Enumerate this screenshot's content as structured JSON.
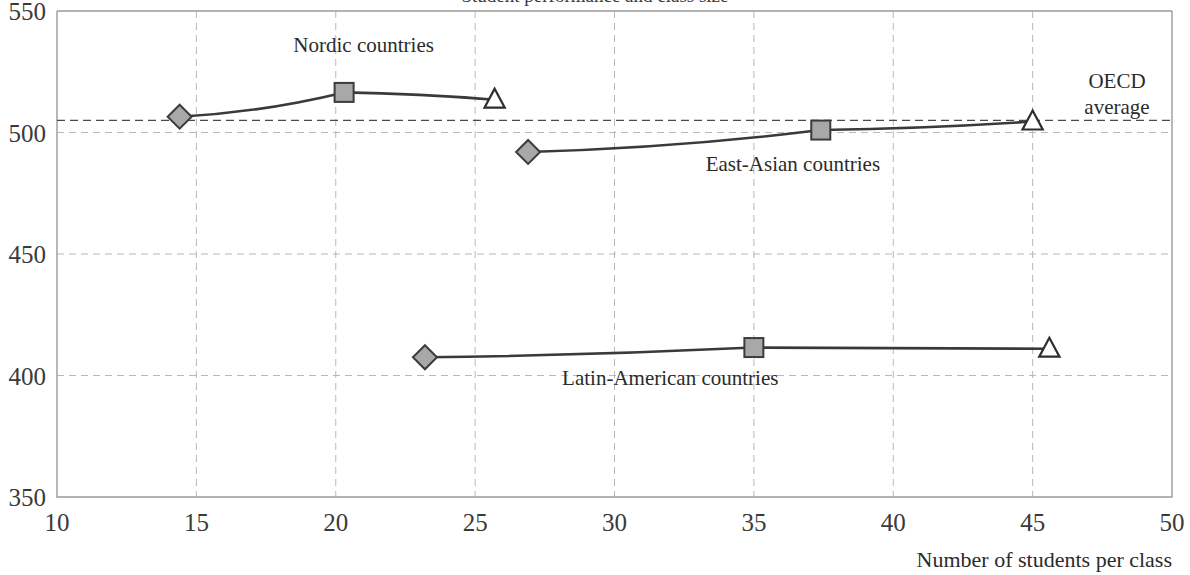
{
  "chart_data": {
    "type": "line",
    "title": "Student performance and class size",
    "xlabel": "Number of students per class",
    "ylabel": "",
    "xlim": [
      10,
      50
    ],
    "ylim": [
      350,
      550
    ],
    "xticks": [
      10,
      15,
      20,
      25,
      30,
      35,
      40,
      45,
      50
    ],
    "yticks": [
      350,
      400,
      450,
      500,
      550
    ],
    "grid": true,
    "legend_position": "inline-annotations",
    "reference_lines": [
      {
        "label": "OECD\naverage",
        "label_line1": "OECD",
        "label_line2": "average",
        "value": 505,
        "axis": "y",
        "style": "dashed"
      }
    ],
    "series": [
      {
        "name": "Nordic countries",
        "label": "Nordic countries",
        "points": [
          {
            "x": 14.4,
            "y": 506.5,
            "marker": "diamond-filled"
          },
          {
            "x": 20.3,
            "y": 516.5,
            "marker": "square-filled"
          },
          {
            "x": 25.7,
            "y": 513.5,
            "marker": "triangle-open"
          }
        ]
      },
      {
        "name": "East-Asian countries",
        "label": "East-Asian countries",
        "points": [
          {
            "x": 26.9,
            "y": 492.0,
            "marker": "diamond-filled"
          },
          {
            "x": 37.4,
            "y": 501.0,
            "marker": "square-filled"
          },
          {
            "x": 45.0,
            "y": 504.5,
            "marker": "triangle-open"
          }
        ]
      },
      {
        "name": "Latin-American countries",
        "label": "Latin-American countries",
        "points": [
          {
            "x": 23.2,
            "y": 407.5,
            "marker": "diamond-filled"
          },
          {
            "x": 35.0,
            "y": 411.5,
            "marker": "square-filled"
          },
          {
            "x": 45.6,
            "y": 411.0,
            "marker": "triangle-open"
          }
        ]
      }
    ],
    "annotations": [
      {
        "text": "Nordic countries",
        "x": 21.0,
        "y": 533
      },
      {
        "text": "East-Asian countries",
        "x": 36.4,
        "y": 484
      },
      {
        "text": "Latin-American countries",
        "x": 32.0,
        "y": 396
      }
    ],
    "colors": {
      "marker_fill": "#a8a8a8",
      "marker_stroke": "#3c3c3c",
      "line": "#3a3a3a",
      "grid": "#b9b9b9",
      "reference_line": "#4a4a4a",
      "text": "#2b2b2b"
    }
  }
}
